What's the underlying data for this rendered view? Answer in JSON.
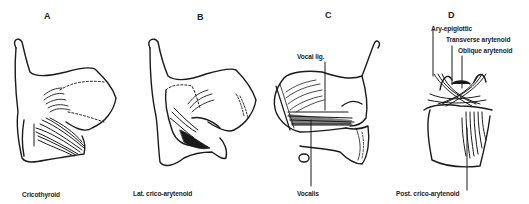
{
  "figure": {
    "panels": [
      {
        "letter": "A",
        "labels": [
          "Cricothyroid"
        ]
      },
      {
        "letter": "B",
        "labels": [
          "Lat. crico-arytenoid"
        ]
      },
      {
        "letter": "C",
        "labels": [
          "Vocal lig.",
          "Vocalis"
        ]
      },
      {
        "letter": "D",
        "labels": [
          "Ary-epiglottic",
          "Transverse arytenoid",
          "Oblique arytenoid",
          "Post. crico-arytenoid"
        ]
      }
    ]
  },
  "colors": {
    "ink": "#1a1a1a",
    "background": "#ffffff"
  }
}
